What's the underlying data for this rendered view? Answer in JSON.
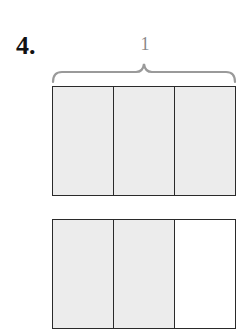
{
  "problem": {
    "number": "4.",
    "whole_label": "1"
  },
  "colors": {
    "shaded": "#ececec",
    "unshaded": "#ffffff",
    "outline": "#2a2a2a",
    "brace": "#9a9a9a"
  },
  "bars": [
    {
      "name": "whole-bar",
      "parts": 3,
      "shaded": [
        true,
        true,
        true
      ]
    },
    {
      "name": "fraction-bar",
      "parts": 3,
      "shaded": [
        true,
        true,
        false
      ]
    }
  ]
}
